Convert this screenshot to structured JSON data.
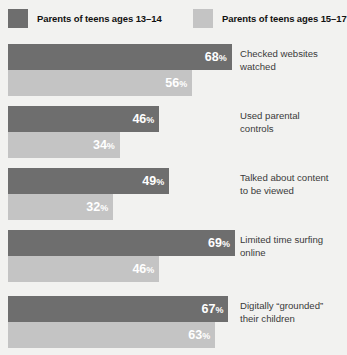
{
  "legend": {
    "entries": [
      {
        "label": "Parents of teens ages 13–14",
        "color": "#6e6e6e",
        "swatch_name": "legend-swatch-dark"
      },
      {
        "label": "Parents of teens ages 15–17",
        "color": "#c4c4c4",
        "swatch_name": "legend-swatch-light"
      }
    ]
  },
  "chart_data": {
    "type": "bar",
    "orientation": "horizontal",
    "title": "",
    "xlabel": "",
    "ylabel": "",
    "xlim": [
      0,
      100
    ],
    "grid": false,
    "legend_position": "top",
    "value_suffix": "%",
    "categories": [
      "Checked websites\nwatched",
      "Used parental\ncontrols",
      "Talked about content\nto be viewed",
      "Limited time surfing\nonline",
      "Digitally “grounded”\ntheir children"
    ],
    "series": [
      {
        "name": "Parents of teens ages 13–14",
        "color": "#6e6e6e",
        "values": [
          68,
          46,
          49,
          69,
          67
        ]
      },
      {
        "name": "Parents of teens ages 15–17",
        "color": "#c4c4c4",
        "values": [
          56,
          34,
          32,
          46,
          63
        ]
      }
    ]
  },
  "groups": [
    {
      "label": "Checked websites\nwatched",
      "dark_value": "68",
      "light_value": "56",
      "dark_pct": 68,
      "light_pct": 56
    },
    {
      "label": "Used parental\ncontrols",
      "dark_value": "46",
      "light_value": "34",
      "dark_pct": 46,
      "light_pct": 34
    },
    {
      "label": "Talked about content\nto be viewed",
      "dark_value": "49",
      "light_value": "32",
      "dark_pct": 49,
      "light_pct": 32
    },
    {
      "label": "Limited time surfing\nonline",
      "dark_value": "69",
      "light_value": "46",
      "dark_pct": 69,
      "light_pct": 46
    },
    {
      "label": "Digitally “grounded”\ntheir children",
      "dark_value": "67",
      "light_value": "63",
      "dark_pct": 67,
      "light_pct": 63
    }
  ],
  "percent_symbol": "%",
  "layout": {
    "bar_origin_x": 8,
    "px_per_percent": 3.29,
    "group_top": [
      44,
      106,
      168,
      230,
      296
    ],
    "bar_height": 26
  }
}
